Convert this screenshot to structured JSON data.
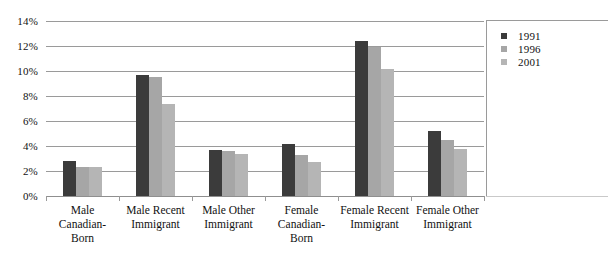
{
  "chart_data": {
    "type": "bar",
    "title": "",
    "subtitle": "",
    "xlabel": "",
    "ylabel": "",
    "ylim": [
      0,
      14
    ],
    "y_tick_step": 2,
    "y_ticks": [
      "0%",
      "2%",
      "4%",
      "6%",
      "8%",
      "10%",
      "12%",
      "14%"
    ],
    "y_tick_values": [
      0,
      2,
      4,
      6,
      8,
      10,
      12,
      14
    ],
    "grid": true,
    "legend_position": "right",
    "categories": [
      "Male Canadian-Born",
      "Male Recent Immigrant",
      "Male Other Immigrant",
      "Female Canadian-Born",
      "Female Recent Immigrant",
      "Female Other Immigrant"
    ],
    "category_lines": [
      [
        "Male",
        "Canadian-",
        "Born"
      ],
      [
        "Male Recent",
        "Immigrant"
      ],
      [
        "Male Other",
        "Immigrant"
      ],
      [
        "Female",
        "Canadian-",
        "Born"
      ],
      [
        "Female Recent",
        "Immigrant"
      ],
      [
        "Female Other",
        "Immigrant"
      ]
    ],
    "series": [
      {
        "name": "1991",
        "color": "#3b3b3b",
        "values": [
          2.8,
          9.7,
          3.7,
          4.2,
          12.4,
          5.2
        ]
      },
      {
        "name": "1996",
        "color": "#a6a6a6",
        "values": [
          2.3,
          9.5,
          3.6,
          3.3,
          11.9,
          4.5
        ]
      },
      {
        "name": "2001",
        "color": "#b5b5b5",
        "values": [
          2.3,
          7.4,
          3.4,
          2.7,
          10.2,
          3.8
        ]
      }
    ]
  },
  "legend": {
    "entries": [
      {
        "label": "1991",
        "color": "#3b3b3b"
      },
      {
        "label": "1996",
        "color": "#a6a6a6"
      },
      {
        "label": "2001",
        "color": "#b5b5b5"
      }
    ]
  },
  "colors": {
    "grid": "#9a9a9a",
    "text": "#111111",
    "background": "#ffffff"
  }
}
